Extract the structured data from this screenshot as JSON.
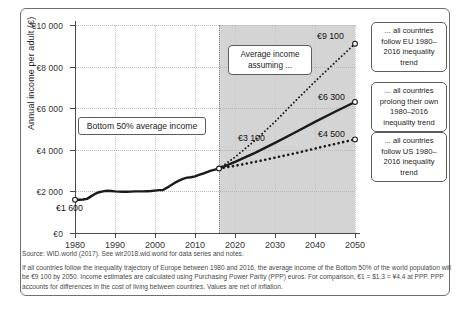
{
  "chart_data": {
    "type": "line",
    "title": "",
    "xlabel": "",
    "ylabel": "Annual income per adult (€)",
    "xlim": [
      1980,
      2050
    ],
    "ylim": [
      0,
      10000
    ],
    "grid": true,
    "legend_position": "right-callouts",
    "x_ticks": [
      "1980",
      "1990",
      "2000",
      "2010",
      "2020",
      "2030",
      "2040",
      "2050"
    ],
    "y_ticks": [
      "€0",
      "€2 000",
      "€4 000",
      "€6 000",
      "€8 000",
      "€10 000"
    ],
    "projection_start_year": 2016,
    "shaded_region_label": "Average income assuming ...",
    "annotations": [
      {
        "name": "start-value",
        "text": "€1 600",
        "x": 1980,
        "y": 1600
      },
      {
        "name": "projection-start-value",
        "text": "€3 100",
        "x": 2016,
        "y": 3100
      },
      {
        "name": "eu-endpoint-value",
        "text": "€9 100",
        "x": 2050,
        "y": 9100
      },
      {
        "name": "own-endpoint-value",
        "text": "€6 300",
        "x": 2050,
        "y": 6300
      },
      {
        "name": "us-endpoint-value",
        "text": "€4 500",
        "x": 2050,
        "y": 4500
      }
    ],
    "series": [
      {
        "name": "Bottom 50% average income (historical)",
        "style": "solid-thick",
        "x": [
          1980,
          1981,
          1982,
          1983,
          1984,
          1985,
          1986,
          1987,
          1988,
          1989,
          1990,
          1991,
          1992,
          1993,
          1994,
          1995,
          1996,
          1997,
          1998,
          1999,
          2000,
          2001,
          2002,
          2003,
          2004,
          2005,
          2006,
          2007,
          2008,
          2009,
          2010,
          2011,
          2012,
          2013,
          2014,
          2015,
          2016
        ],
        "values": [
          1600,
          1600,
          1610,
          1640,
          1760,
          1880,
          1960,
          2000,
          2030,
          2020,
          2000,
          1990,
          1980,
          1980,
          1990,
          2000,
          2000,
          2000,
          2010,
          2020,
          2040,
          2060,
          2070,
          2180,
          2300,
          2420,
          2520,
          2600,
          2660,
          2680,
          2720,
          2790,
          2860,
          2930,
          3000,
          3050,
          3100
        ]
      },
      {
        "name": "... all countries follow EU 1980–2016 inequality trend",
        "style": "fine-dotted",
        "x": [
          2016,
          2020,
          2025,
          2030,
          2035,
          2040,
          2045,
          2050
        ],
        "values": [
          3100,
          3650,
          4450,
          5350,
          6330,
          7280,
          8200,
          9100
        ]
      },
      {
        "name": "... all countries prolong their own 1980–2016 inequality trend",
        "style": "solid-thick",
        "x": [
          2016,
          2020,
          2025,
          2030,
          2035,
          2040,
          2045,
          2050
        ],
        "values": [
          3100,
          3420,
          3850,
          4330,
          4830,
          5340,
          5830,
          6300
        ]
      },
      {
        "name": "... all countries follow US 1980–2016 inequality trend",
        "style": "coarse-dashed",
        "x": [
          2016,
          2020,
          2025,
          2030,
          2035,
          2040,
          2045,
          2050
        ],
        "values": [
          3100,
          3230,
          3420,
          3620,
          3830,
          4060,
          4280,
          4500
        ]
      }
    ]
  },
  "axis": {
    "y_title": "Annual income per adult (€)",
    "y_ticks": [
      {
        "label": "€10 000",
        "value": 10000
      },
      {
        "label": "€8 000",
        "value": 8000
      },
      {
        "label": "€6 000",
        "value": 6000
      },
      {
        "label": "€4 000",
        "value": 4000
      },
      {
        "label": "€2 000",
        "value": 2000
      },
      {
        "label": "€0",
        "value": 0
      }
    ],
    "x_ticks": [
      {
        "label": "1980",
        "value": 1980
      },
      {
        "label": "1990",
        "value": 1990
      },
      {
        "label": "2000",
        "value": 2000
      },
      {
        "label": "2010",
        "value": 2010
      },
      {
        "label": "2020",
        "value": 2020
      },
      {
        "label": "2030",
        "value": 2030
      },
      {
        "label": "2040",
        "value": 2040
      },
      {
        "label": "2050",
        "value": 2050
      }
    ]
  },
  "labels": {
    "bottom50_box": "Bottom 50%  average income",
    "average_income_box": "Average income assuming ...",
    "value_1600": "€1 600",
    "value_3100": "€3 100",
    "value_9100": "€9 100",
    "value_6300": "€6 300",
    "value_4500": "€4 500"
  },
  "callouts": {
    "eu": "... all countries follow EU 1980–2016 inequality trend",
    "own": "... all countries prolong their own 1980–2016 inequality trend",
    "us": "... all countries follow US 1980–2016 inequality trend"
  },
  "notes": {
    "source": "Source: WID.world (2017). See wir2018.wid.world for data series and notes.",
    "body": "If all countries follow the inequality trajectory of Europe between 1980 and 2016, the average income of the Bottom 50% of the world population will be €9 100 by 2050. Income estimates are calculated using Purchasing Power Parity (PPP) euros. For comparison, €1 = $1.3 = ¥4.4 at PPP. PPP accounts for differences in the cost of living between countries. Values are net of inflation."
  },
  "colors": {
    "shaded_region": "#d4d4d4",
    "line": "#1a1a1a",
    "axis": "#4a4a4a",
    "grid": "#b9b9b9",
    "frame": "#6f6f6f",
    "note_text": "#4a4a4a"
  }
}
